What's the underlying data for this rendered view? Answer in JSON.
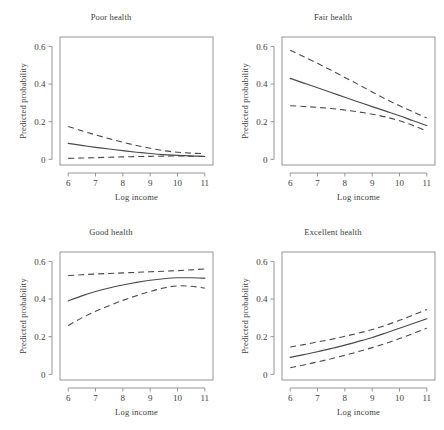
{
  "figure": {
    "background": "#ffffff",
    "line_color": "#4a4a4a",
    "axis_color": "#8a8a8a",
    "rows": 2,
    "cols": 2
  },
  "chart_data": [
    {
      "type": "line",
      "title": "Poor health",
      "xlabel": "Log income",
      "ylabel": "Predicted probability",
      "xlim": [
        5.7,
        11.3
      ],
      "ylim": [
        -0.03,
        0.65
      ],
      "xticks": [
        6,
        7,
        8,
        9,
        10,
        11
      ],
      "xticklabels": [
        "6",
        "7",
        "8",
        "9",
        "10",
        "11"
      ],
      "yticks": [
        0,
        0.2,
        0.4,
        0.6
      ],
      "yticklabels": [
        "0",
        "0.2",
        "0.4",
        "0.6"
      ],
      "grid": false,
      "legend": "none",
      "x": [
        6,
        6.5,
        7,
        7.5,
        8,
        8.5,
        9,
        9.5,
        10,
        10.5,
        11
      ],
      "series": [
        {
          "name": "Predicted probability",
          "style": "solid",
          "values": [
            0.085,
            0.074,
            0.064,
            0.055,
            0.046,
            0.038,
            0.031,
            0.025,
            0.021,
            0.018,
            0.015
          ]
        },
        {
          "name": "Upper confidence bound",
          "style": "dashed",
          "values": [
            0.175,
            0.152,
            0.13,
            0.11,
            0.091,
            0.074,
            0.059,
            0.046,
            0.038,
            0.033,
            0.03
          ]
        },
        {
          "name": "Lower confidence bound",
          "style": "dashed",
          "values": [
            0.005,
            0.007,
            0.009,
            0.011,
            0.013,
            0.015,
            0.016,
            0.017,
            0.018,
            0.017,
            0.016
          ]
        }
      ]
    },
    {
      "type": "line",
      "title": "Fair health",
      "xlabel": "Log income",
      "ylabel": "Predicted probability",
      "xlim": [
        5.7,
        11.3
      ],
      "ylim": [
        -0.03,
        0.65
      ],
      "xticks": [
        6,
        7,
        8,
        9,
        10,
        11
      ],
      "xticklabels": [
        "6",
        "7",
        "8",
        "9",
        "10",
        "11"
      ],
      "yticks": [
        0,
        0.2,
        0.4,
        0.6
      ],
      "yticklabels": [
        "0",
        "0.2",
        "0.4",
        "0.6"
      ],
      "grid": false,
      "legend": "none",
      "x": [
        6,
        6.5,
        7,
        7.5,
        8,
        8.5,
        9,
        9.5,
        10,
        10.5,
        11
      ],
      "series": [
        {
          "name": "Predicted probability",
          "style": "solid",
          "values": [
            0.43,
            0.405,
            0.38,
            0.355,
            0.33,
            0.305,
            0.28,
            0.256,
            0.232,
            0.205,
            0.18
          ]
        },
        {
          "name": "Upper confidence bound",
          "style": "dashed",
          "values": [
            0.58,
            0.545,
            0.51,
            0.473,
            0.435,
            0.397,
            0.358,
            0.32,
            0.285,
            0.252,
            0.22
          ]
        },
        {
          "name": "Lower confidence bound",
          "style": "dashed",
          "values": [
            0.285,
            0.281,
            0.276,
            0.27,
            0.262,
            0.252,
            0.24,
            0.225,
            0.205,
            0.18,
            0.15
          ]
        }
      ]
    },
    {
      "type": "line",
      "title": "Good health",
      "xlabel": "Log income",
      "ylabel": "Predicted probability",
      "xlim": [
        5.7,
        11.3
      ],
      "ylim": [
        -0.03,
        0.65
      ],
      "xticks": [
        6,
        7,
        8,
        9,
        10,
        11
      ],
      "xticklabels": [
        "6",
        "7",
        "8",
        "9",
        "10",
        "11"
      ],
      "yticks": [
        0,
        0.2,
        0.4,
        0.6
      ],
      "yticklabels": [
        "0",
        "0.2",
        "0.4",
        "0.6"
      ],
      "grid": false,
      "legend": "none",
      "x": [
        6,
        6.5,
        7,
        7.5,
        8,
        8.5,
        9,
        9.5,
        10,
        10.5,
        11
      ],
      "series": [
        {
          "name": "Predicted probability",
          "style": "solid",
          "values": [
            0.39,
            0.417,
            0.44,
            0.459,
            0.475,
            0.489,
            0.5,
            0.508,
            0.513,
            0.513,
            0.511
          ]
        },
        {
          "name": "Upper confidence bound",
          "style": "dashed",
          "values": [
            0.525,
            0.529,
            0.533,
            0.536,
            0.539,
            0.542,
            0.545,
            0.548,
            0.551,
            0.555,
            0.56
          ]
        },
        {
          "name": "Lower confidence bound",
          "style": "dashed",
          "values": [
            0.26,
            0.3,
            0.335,
            0.365,
            0.393,
            0.418,
            0.44,
            0.459,
            0.47,
            0.468,
            0.458
          ]
        }
      ]
    },
    {
      "type": "line",
      "title": "Excellent health",
      "xlabel": "Log income",
      "ylabel": "Predicted probability",
      "xlim": [
        5.7,
        11.3
      ],
      "ylim": [
        -0.03,
        0.65
      ],
      "xticks": [
        6,
        7,
        8,
        9,
        10,
        11
      ],
      "xticklabels": [
        "6",
        "7",
        "8",
        "9",
        "10",
        "11"
      ],
      "yticks": [
        0,
        0.2,
        0.4,
        0.6
      ],
      "yticklabels": [
        "0",
        "0.2",
        "0.4",
        "0.6"
      ],
      "grid": false,
      "legend": "none",
      "x": [
        6,
        6.5,
        7,
        7.5,
        8,
        8.5,
        9,
        9.5,
        10,
        10.5,
        11
      ],
      "series": [
        {
          "name": "Predicted probability",
          "style": "solid",
          "values": [
            0.09,
            0.105,
            0.12,
            0.137,
            0.155,
            0.175,
            0.196,
            0.22,
            0.245,
            0.27,
            0.295
          ]
        },
        {
          "name": "Upper confidence bound",
          "style": "dashed",
          "values": [
            0.145,
            0.158,
            0.172,
            0.186,
            0.202,
            0.219,
            0.238,
            0.261,
            0.287,
            0.315,
            0.345
          ]
        },
        {
          "name": "Lower confidence bound",
          "style": "dashed",
          "values": [
            0.035,
            0.05,
            0.066,
            0.083,
            0.101,
            0.121,
            0.142,
            0.165,
            0.19,
            0.217,
            0.245
          ]
        }
      ]
    }
  ]
}
